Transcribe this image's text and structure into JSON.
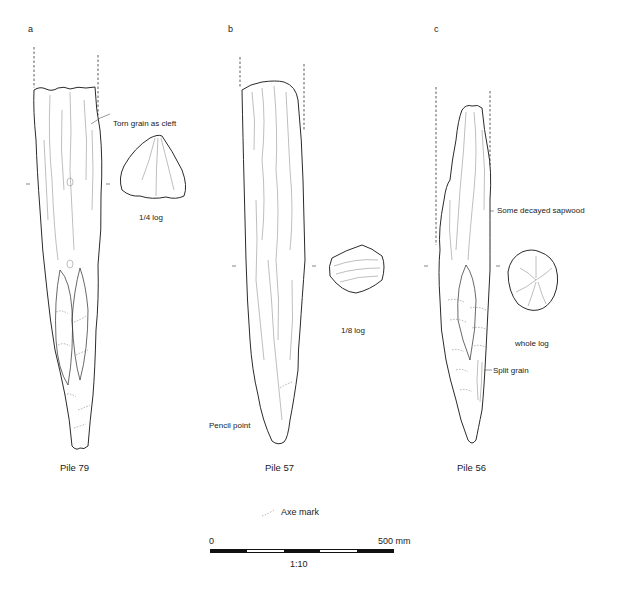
{
  "figure": {
    "panels": [
      {
        "letter": "a",
        "pile_label": "Pile 79",
        "section_label": "1/4 log",
        "annotations": [
          "Torn grain as cleft"
        ]
      },
      {
        "letter": "b",
        "pile_label": "Pile 57",
        "section_label": "1/8 log",
        "annotations": [
          "Pencil point"
        ]
      },
      {
        "letter": "c",
        "pile_label": "Pile 56",
        "section_label": "whole log",
        "annotations": [
          "Some decayed sapwood",
          "Split grain"
        ]
      }
    ],
    "legend": {
      "axe_mark_label": "Axe mark",
      "axe_mark_icon": "dashed-curve-icon"
    },
    "scale_bar": {
      "start_label": "0",
      "end_label": "500 mm",
      "ratio_label": "1:10",
      "segments": [
        "black",
        "white",
        "black",
        "white",
        "black"
      ]
    },
    "colors": {
      "line": "#2a2a2a",
      "grain": "#888888",
      "background": "#ffffff"
    }
  }
}
